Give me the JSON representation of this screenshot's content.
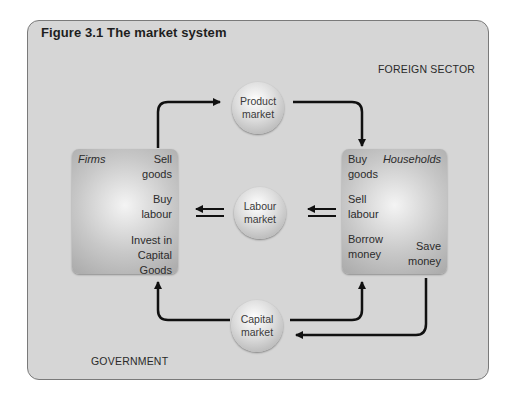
{
  "figure": {
    "title": "Figure 3.1  The market system",
    "sectors": {
      "foreign": "FOREIGN SECTOR",
      "government": "GOVERNMENT"
    },
    "firms": {
      "label": "Firms",
      "items": [
        "Sell goods",
        "Buy labour",
        "Invest in Capital Goods"
      ]
    },
    "households": {
      "label": "Households",
      "items": [
        "Buy goods",
        "Sell labour",
        "Borrow money",
        "Save money"
      ]
    },
    "markets": {
      "product": "Product\nmarket",
      "labour": "Labour\nmarket",
      "capital": "Capital\nmarket"
    },
    "colors": {
      "panel": "#d6d6d6",
      "arrow": "#111111",
      "text": "#2b2b2b"
    }
  }
}
